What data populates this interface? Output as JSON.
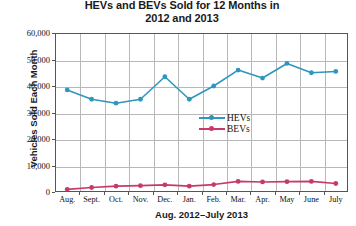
{
  "chart_data": {
    "type": "line",
    "title": "HEVs and BEVs Sold for 12 Months in 2012 and 2013",
    "title_line1": "HEVs and BEVs Sold for 12 Months in",
    "title_line2": "2012 and 2013",
    "xlabel": "Aug. 2012–July 2013",
    "ylabel": "Vehicles Sold Each Month",
    "categories": [
      "Aug.",
      "Sept.",
      "Oct.",
      "Nov.",
      "Dec.",
      "Jan.",
      "Feb.",
      "Mar.",
      "Apr.",
      "May",
      "June",
      "July"
    ],
    "ylim": [
      0,
      60000
    ],
    "yticks": [
      0,
      10000,
      20000,
      30000,
      40000,
      50000,
      60000
    ],
    "ytick_labels": [
      "0",
      "10,000",
      "20,000",
      "30,000",
      "40,000",
      "50,000",
      "60,000"
    ],
    "grid": true,
    "legend_position": "center",
    "series": [
      {
        "name": "HEVs",
        "color": "#2f96bd",
        "values": [
          38500,
          35000,
          33500,
          35000,
          43500,
          35000,
          40000,
          46000,
          43000,
          48500,
          45000,
          45500
        ]
      },
      {
        "name": "BEVs",
        "color": "#c8396b",
        "values": [
          1000,
          1700,
          2200,
          2400,
          2700,
          2200,
          2800,
          4000,
          3800,
          3900,
          4000,
          3200
        ]
      }
    ]
  },
  "legend": {
    "items": [
      {
        "label": "HEVs",
        "color": "#2f96bd"
      },
      {
        "label": "BEVs",
        "color": "#c8396b"
      }
    ]
  },
  "colors": {
    "hev": "#2f96bd",
    "bev": "#c8396b",
    "grid": "#b8b8b8",
    "frame": "#555555",
    "text": "#111111"
  }
}
